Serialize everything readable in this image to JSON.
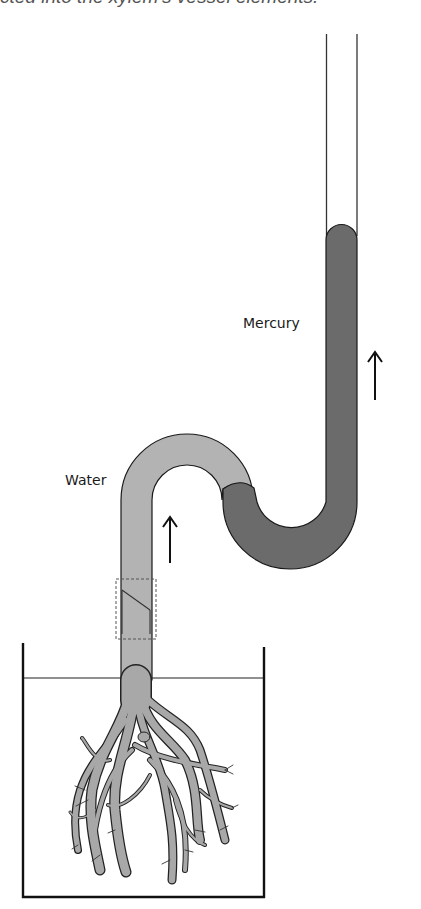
{
  "caption_clipped": "cted into the xylem's vessel elements.",
  "labels": {
    "mercury": "Mercury",
    "water": "Water"
  },
  "colors": {
    "mercury_fill": "#6b6b6b",
    "water_fill": "#b3b3b3",
    "root_fill": "#a8a8a8",
    "outline": "#1a1a1a"
  },
  "arrows": [
    {
      "name": "mercury-rise-arrow",
      "direction": "up"
    },
    {
      "name": "water-rise-arrow",
      "direction": "up"
    }
  ],
  "components": [
    "glass-tube",
    "mercury-column",
    "water-column",
    "junction-detail-box",
    "beaker",
    "water-surface",
    "plant-roots"
  ]
}
